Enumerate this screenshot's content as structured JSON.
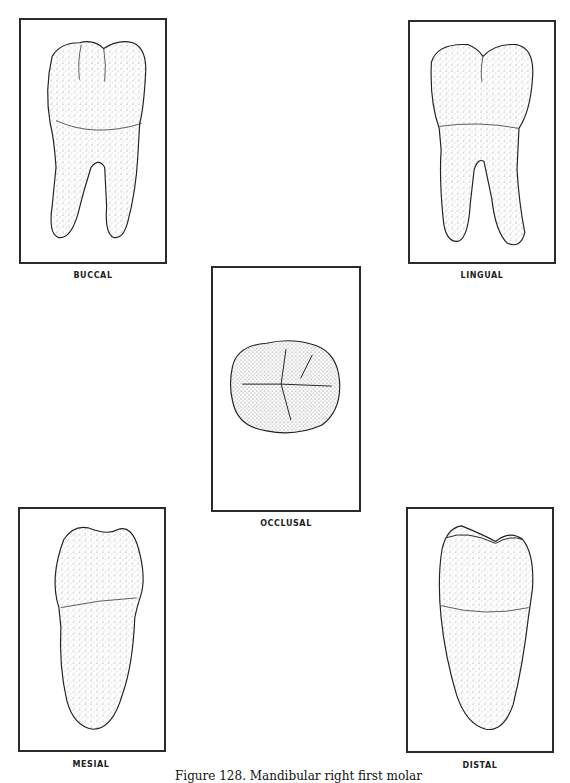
{
  "figure": {
    "caption": "Figure 128. Mandibular right first molar",
    "views": [
      {
        "id": "buccal",
        "label": "BUCCAL"
      },
      {
        "id": "lingual",
        "label": "LINGUAL"
      },
      {
        "id": "occlusal",
        "label": "OCCLUSAL"
      },
      {
        "id": "mesial",
        "label": "MESIAL"
      },
      {
        "id": "distal",
        "label": "DISTAL"
      }
    ]
  }
}
